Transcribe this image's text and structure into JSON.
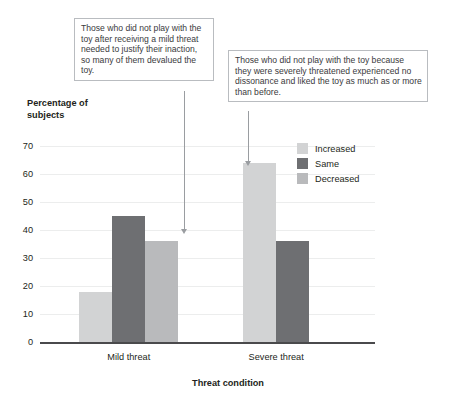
{
  "chart_data": {
    "type": "bar",
    "title": "",
    "xlabel": "Threat condition",
    "ylabel": "Percentage of\nsubjects",
    "categories": [
      "Mild threat",
      "Severe threat"
    ],
    "series": [
      {
        "name": "Increased",
        "values": [
          18,
          64
        ],
        "color": "#d2d3d4"
      },
      {
        "name": "Same",
        "values": [
          45,
          36
        ],
        "color": "#6e6f72"
      },
      {
        "name": "Decreased",
        "values": [
          36,
          null
        ],
        "color": "#b9babc"
      }
    ],
    "ylim": [
      0,
      70
    ],
    "yticks": [
      0,
      10,
      20,
      30,
      40,
      50,
      60,
      70
    ],
    "grid": true,
    "legend_position": "top-right",
    "annotations": [
      {
        "id": "mild",
        "text": "Those who did not play with the toy after receiving a mild threat needed to justify their inaction, so many of them devalued the toy.",
        "points_to": "Mild threat / Decreased (36)"
      },
      {
        "id": "severe",
        "text": "Those who did not play with the toy because they were severely threatened experienced no dissonance and liked the toy as much as or more than before.",
        "points_to": "Severe threat / Increased (64)"
      }
    ]
  }
}
